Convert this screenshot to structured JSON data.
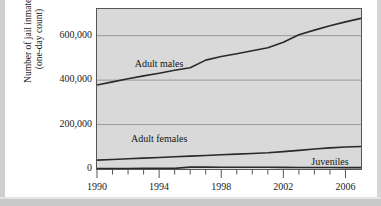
{
  "chart_data": {
    "type": "line",
    "title": "",
    "xlabel": "",
    "ylabel": "Number of jail inmates (one-day count)",
    "ylabel_line1": "Number of jail inmates",
    "ylabel_line2": "(one-day count)",
    "xlim": [
      1990,
      2007
    ],
    "ylim": [
      0,
      720000
    ],
    "grid": true,
    "grid_axis": "y",
    "legend_position": "inline-annotations",
    "yticks": [
      0,
      200000,
      400000,
      600000
    ],
    "ytick_labels": [
      "0",
      "200,000",
      "400,000",
      "600,000"
    ],
    "xticks": [
      1990,
      1991,
      1992,
      1993,
      1994,
      1995,
      1996,
      1997,
      1998,
      1999,
      2000,
      2001,
      2002,
      2003,
      2004,
      2005,
      2006
    ],
    "xtick_labels_shown": [
      "1990",
      "1994",
      "1998",
      "2002",
      "2006"
    ],
    "xtick_labels_shown_values": [
      1990,
      1994,
      1998,
      2002,
      2006
    ],
    "x": [
      1990,
      1991,
      1992,
      1993,
      1994,
      1995,
      1996,
      1997,
      1998,
      1999,
      2000,
      2001,
      2002,
      2003,
      2004,
      2005,
      2006,
      2007
    ],
    "series": [
      {
        "name": "Adult males",
        "color": "#2a2a2a",
        "label_x": 1994.0,
        "label_y": 470000,
        "values": [
          378000,
          392000,
          406000,
          419000,
          431000,
          444000,
          456000,
          490000,
          506000,
          519000,
          532000,
          546000,
          570000,
          604000,
          625000,
          645000,
          662000,
          678000
        ]
      },
      {
        "name": "Adult females",
        "color": "#2a2a2a",
        "label_x": 1994.0,
        "label_y": 130000,
        "values": [
          40000,
          43000,
          46000,
          49000,
          52000,
          55000,
          58000,
          61000,
          64000,
          67000,
          70000,
          73000,
          78000,
          84000,
          90000,
          95000,
          99000,
          101000
        ]
      },
      {
        "name": "Juveniles",
        "color": "#2a2a2a",
        "label_x": 2005.0,
        "label_y": 28000,
        "values": [
          2300,
          2400,
          2500,
          2600,
          2700,
          2800,
          8300,
          9100,
          8100,
          7600,
          7600,
          7600,
          7200,
          6900,
          7000,
          6800,
          6100,
          6000
        ]
      }
    ],
    "annotations": [
      {
        "name": "adult-males-label",
        "text": "Adult males"
      },
      {
        "name": "adult-females-label",
        "text": "Adult females"
      },
      {
        "name": "juveniles-label",
        "text": "Juveniles"
      }
    ],
    "colors": {
      "plot_background": "#d9d9d9",
      "gridline": "#9a9a9a",
      "frame": "#555555",
      "line": "#2a2a2a",
      "text": "#1a1a1a",
      "page_background": "#ffffff"
    }
  }
}
